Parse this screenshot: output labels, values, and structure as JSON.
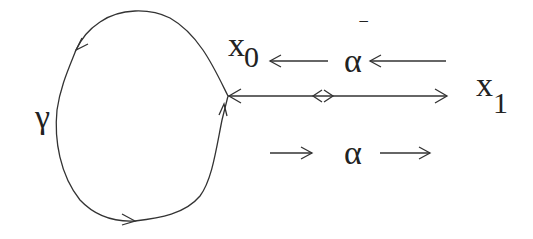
{
  "diagram": {
    "type": "path-loop",
    "labels": {
      "gamma": "γ",
      "x0_base": "x",
      "x0_sub": "0",
      "x1_base": "x",
      "x1_sub": "1",
      "alpha_bar": "α",
      "alpha_bar_mark": "‾",
      "alpha": "α"
    },
    "nodes": [
      {
        "id": "x0",
        "label": "x0",
        "position": [
          228,
          96
        ]
      },
      {
        "id": "x1",
        "label": "x1",
        "position": [
          447,
          96
        ]
      }
    ],
    "edges": [
      {
        "id": "gamma",
        "label": "γ",
        "from": "x0",
        "to": "x0",
        "shape": "loop",
        "direction": "counter-clockwise"
      },
      {
        "id": "alpha",
        "label": "α",
        "from": "x0",
        "to": "x1",
        "direction": "right"
      },
      {
        "id": "alpha_bar",
        "label": "α‾",
        "from": "x1",
        "to": "x0",
        "direction": "left"
      }
    ],
    "colors": {
      "stroke": "#333333",
      "text": "#222222",
      "background": "#ffffff"
    }
  }
}
